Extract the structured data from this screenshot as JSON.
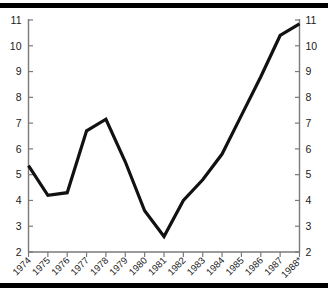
{
  "chart_data": {
    "type": "line",
    "title": "",
    "subtitle": "",
    "xlabel": "",
    "ylabel": "",
    "categories": [
      "1974",
      "1975",
      "1976",
      "1977",
      "1978",
      "1979",
      "1980",
      "1981",
      "1982",
      "1983",
      "1984",
      "1985",
      "1986",
      "1987",
      "1988*"
    ],
    "x_tick_labels": [
      "1974",
      "1975",
      "1976",
      "1977",
      "1978",
      "1979",
      "1980",
      "1981",
      "1982",
      "1983",
      "1984",
      "1985",
      "1986",
      "1987",
      "1988*"
    ],
    "x_tick_rotation": 45,
    "values": [
      5.35,
      4.2,
      4.3,
      6.7,
      7.15,
      5.5,
      3.6,
      2.6,
      4.0,
      4.8,
      5.8,
      7.3,
      8.8,
      10.4,
      10.85
    ],
    "series": [
      {
        "name": "series-1",
        "color": "#111111",
        "values": [
          5.35,
          4.2,
          4.3,
          6.7,
          7.15,
          5.5,
          3.6,
          2.6,
          4.0,
          4.8,
          5.8,
          7.3,
          8.8,
          10.4,
          10.85
        ]
      }
    ],
    "ylim": [
      2,
      11
    ],
    "y_tick_labels": [
      "2",
      "3",
      "4",
      "5",
      "6",
      "7",
      "8",
      "9",
      "10",
      "11"
    ],
    "y_tick_values": [
      2,
      3,
      4,
      5,
      6,
      7,
      8,
      9,
      10,
      11
    ],
    "left_axis": {
      "labels": [
        "11",
        "10",
        "9",
        "8",
        "7",
        "6",
        "5",
        "4",
        "3",
        "2"
      ],
      "min": 2,
      "max": 11
    },
    "right_axis": {
      "labels": [
        "11",
        "10",
        "9",
        "8",
        "7",
        "6",
        "5",
        "4",
        "3",
        "2"
      ],
      "min": 2,
      "max": 11
    },
    "grid": false,
    "legend": false,
    "legend_position": "none",
    "markers": false,
    "annotations": [],
    "colors": {
      "line": "#111111",
      "axis": "#7a7a7a",
      "text": "#1a1a1a",
      "rule": "#000000",
      "background": "#ffffff"
    }
  }
}
